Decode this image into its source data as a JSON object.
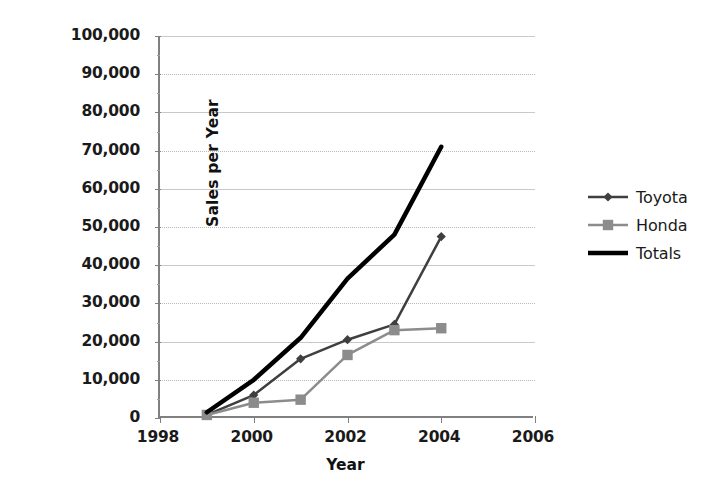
{
  "chart_data": {
    "type": "line",
    "title": "",
    "xlabel": "Year",
    "ylabel": "Sales per Year",
    "x": [
      1999,
      2000,
      2001,
      2002,
      2003,
      2004
    ],
    "xlim": [
      1998,
      2006
    ],
    "ylim": [
      0,
      100000
    ],
    "xticks": [
      1998,
      2000,
      2002,
      2004,
      2006
    ],
    "xtick_labels": [
      "1998",
      "2000",
      "2002",
      "2004",
      "2006"
    ],
    "yticks": [
      0,
      10000,
      20000,
      30000,
      40000,
      50000,
      60000,
      70000,
      80000,
      90000,
      100000
    ],
    "ytick_labels": [
      "0",
      "10,000",
      "20,000",
      "30,000",
      "40,000",
      "50,000",
      "60,000",
      "70,000",
      "80,000",
      "90,000",
      "100,000"
    ],
    "grid": true,
    "legend_position": "right",
    "series": [
      {
        "name": "Toyota",
        "marker": "diamond",
        "color": "#3f3f3f",
        "line_width": 2.5,
        "values": [
          800,
          6000,
          15500,
          20500,
          24500,
          47500
        ]
      },
      {
        "name": "Honda",
        "marker": "square",
        "color": "#8c8c8c",
        "line_width": 2.5,
        "values": [
          800,
          4000,
          4800,
          16500,
          23000,
          23500
        ]
      },
      {
        "name": "Totals",
        "marker": "none",
        "color": "#000000",
        "line_width": 4.5,
        "values": [
          1500,
          10000,
          21000,
          36500,
          48000,
          71000
        ]
      }
    ]
  },
  "legend": {
    "entries": [
      {
        "label": "Toyota"
      },
      {
        "label": "Honda"
      },
      {
        "label": "Totals"
      }
    ]
  },
  "axes": {
    "x_title": "Year",
    "y_title": "Sales per Year"
  },
  "colors": {
    "toyota": "#3f3f3f",
    "honda": "#8c8c8c",
    "totals": "#000000",
    "axis": "#808080",
    "grid": "#c9c9c9",
    "text": "#1a1a1a",
    "background": "#ffffff"
  }
}
